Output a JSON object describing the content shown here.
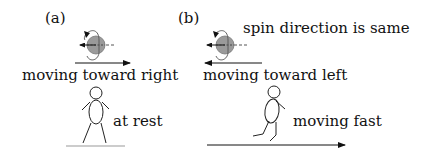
{
  "panels": [
    {
      "id": "a",
      "label": "(a)",
      "motion_caption": "moving toward right",
      "observer_caption": "at rest",
      "ball_color": "#9a9a9a",
      "motion_direction": "right"
    },
    {
      "id": "b",
      "label": "(b)",
      "note": "spin direction is same",
      "motion_caption": "moving toward left",
      "observer_caption": "moving fast",
      "ball_color": "#9a9a9a",
      "motion_direction": "left",
      "observer_direction": "right"
    }
  ]
}
